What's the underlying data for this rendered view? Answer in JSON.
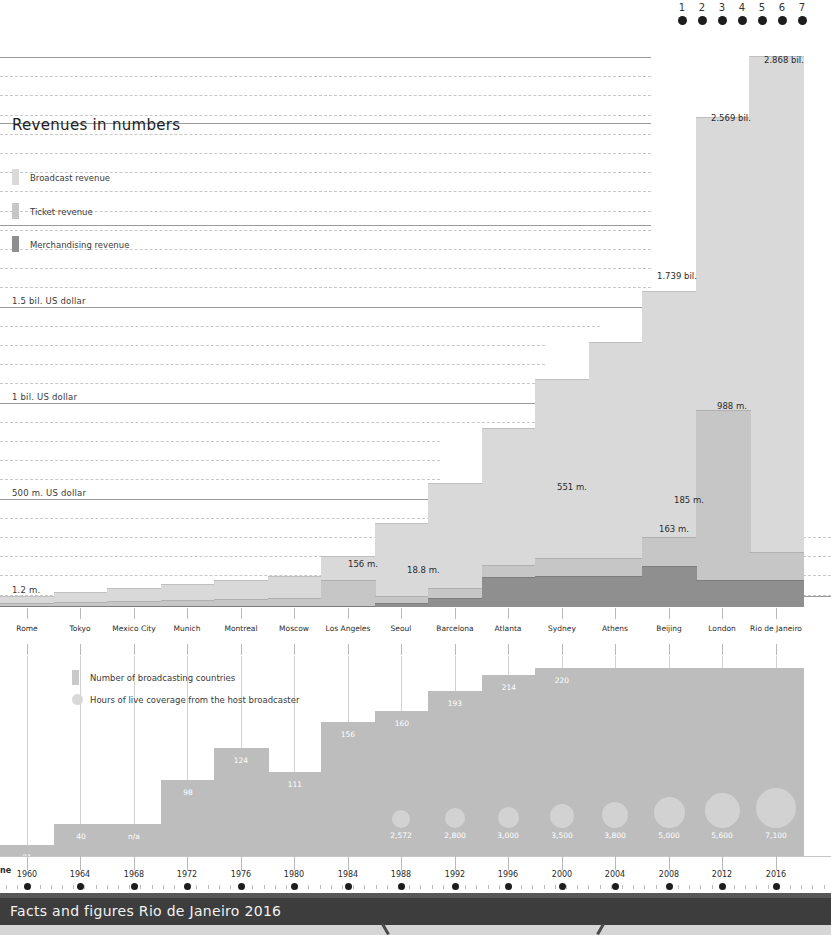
{
  "page_dots": {
    "numbers": [
      "1",
      "2",
      "3",
      "4",
      "5",
      "6",
      "7"
    ],
    "active_color": "#1d1d1d"
  },
  "revenue_section": {
    "title": "Revenues in numbers",
    "legend": [
      {
        "label": "Broadcast revenue",
        "color": "#d9d9d9"
      },
      {
        "label": "Ticket revenue",
        "color": "#c6c6c6"
      },
      {
        "label": "Merchandising revenue",
        "color": "#8f8f8f"
      }
    ],
    "axis_labels": [
      {
        "text": "1.5 bil. US dollar",
        "y": 307
      },
      {
        "text": "1 bil. US dollar",
        "y": 403
      },
      {
        "text": "500 m. US dollar",
        "y": 499
      },
      {
        "text": "1.2 m.",
        "y": 596
      }
    ],
    "value_labels": [
      {
        "text": "2.868 bil.",
        "x": 764,
        "y": 55
      },
      {
        "text": "2.569 bil.",
        "x": 711,
        "y": 113
      },
      {
        "text": "1.739 bil.",
        "x": 657,
        "y": 271
      },
      {
        "text": "988 m.",
        "x": 717,
        "y": 401
      },
      {
        "text": "551 m.",
        "x": 557,
        "y": 482
      },
      {
        "text": "185 m.",
        "x": 674,
        "y": 495
      },
      {
        "text": "163 m.",
        "x": 659,
        "y": 524
      },
      {
        "text": "156 m.",
        "x": 348,
        "y": 559
      },
      {
        "text": "18.8 m.",
        "x": 407,
        "y": 565
      }
    ]
  },
  "cities": [
    "Rome",
    "Tokyo",
    "Mexico City",
    "Munich",
    "Montreal",
    "Moscow",
    "Los Angeles",
    "Seoul",
    "Barcelona",
    "Atlanta",
    "Sydney",
    "Athens",
    "Beijing",
    "London",
    "Rio de Janeiro"
  ],
  "broadcast_section": {
    "legend": [
      {
        "label": "Number of broadcasting countries",
        "shape": "square-swatch"
      },
      {
        "label": "Hours of live coverage from the host broadcaster",
        "shape": "circle-swatch"
      }
    ]
  },
  "timeline": {
    "cut_label": "ne",
    "years": [
      "1960",
      "1964",
      "1968",
      "1972",
      "1976",
      "1980",
      "1984",
      "1988",
      "1992",
      "1996",
      "2000",
      "2004",
      "2008",
      "2012",
      "2016"
    ]
  },
  "footer": {
    "title": "Facts and figures Rio de Janeiro 2016"
  },
  "chart_data": [
    {
      "type": "bar",
      "title": "Revenues in numbers",
      "xlabel": "",
      "ylabel": "US dollar",
      "ylim": [
        0,
        3000000000
      ],
      "grid": true,
      "legend_position": "top-left",
      "categories": [
        "Rome",
        "Tokyo",
        "Mexico City",
        "Munich",
        "Montreal",
        "Moscow",
        "Los Angeles",
        "Seoul",
        "Barcelona",
        "Atlanta",
        "Sydney",
        "Athens",
        "Beijing",
        "London",
        "Rio de Janeiro"
      ],
      "years": [
        1960,
        1964,
        1968,
        1972,
        1976,
        1980,
        1984,
        1988,
        1992,
        1996,
        2000,
        2004,
        2008,
        2012,
        2016
      ],
      "annotations": [
        "2.868 bil.",
        "2.569 bil.",
        "1.739 bil.",
        "988 m.",
        "551 m.",
        "185 m.",
        "163 m.",
        "156 m.",
        "18.8 m.",
        "1.2 m."
      ],
      "series": [
        {
          "name": "Broadcast revenue",
          "values_display": [
            "1.2 m.",
            "",
            "",
            "",
            "",
            "",
            "156 m.",
            "",
            "",
            "551 m.",
            "",
            "",
            "1.739 bil.",
            "2.569 bil.",
            "2.868 bil."
          ],
          "top_px": [
            596,
            592,
            588,
            584,
            580,
            576,
            556,
            523,
            483,
            428,
            379,
            342,
            291,
            117,
            56
          ]
        },
        {
          "name": "Ticket revenue",
          "values_display": [
            "",
            "",
            "",
            "",
            "",
            "",
            "",
            "18.8 m.",
            "",
            "",
            "",
            "",
            "988 m.",
            "",
            ""
          ],
          "top_px": [
            603,
            602,
            601,
            600,
            599,
            598,
            580,
            596,
            588,
            565,
            558,
            558,
            537,
            410,
            552
          ]
        },
        {
          "name": "Merchandising revenue",
          "values_display": [
            "",
            "",
            "",
            "",
            "",
            "",
            "",
            "",
            "",
            "",
            "",
            "163 m.",
            "185 m.",
            "",
            ""
          ],
          "top_px": [
            606,
            606,
            606,
            606,
            606,
            606,
            606,
            603,
            598,
            577,
            576,
            576,
            566,
            580,
            580
          ]
        }
      ]
    },
    {
      "type": "bar",
      "title": "Number of broadcasting countries",
      "xlabel": "",
      "ylabel": "countries",
      "grid": true,
      "categories": [
        "Rome",
        "Tokyo",
        "Mexico City",
        "Munich",
        "Montreal",
        "Moscow",
        "Los Angeles",
        "Seoul",
        "Barcelona",
        "Atlanta",
        "Sydney",
        "Athens",
        "Beijing",
        "London",
        "Rio de Janeiro"
      ],
      "values": [
        21,
        40,
        null,
        98,
        124,
        111,
        156,
        160,
        193,
        214,
        220,
        220,
        220,
        220,
        220
      ],
      "value_labels": [
        "21",
        "40",
        "n/a",
        "98",
        "124",
        "111",
        "156",
        "160",
        "193",
        "214",
        "220",
        "",
        "",
        "",
        ""
      ]
    },
    {
      "type": "scatter",
      "title": "Hours of live coverage from the host broadcaster",
      "xlabel": "",
      "ylabel": "hours",
      "categories": [
        "Seoul",
        "Barcelona",
        "Atlanta",
        "Sydney",
        "Athens",
        "Beijing",
        "London",
        "Rio de Janeiro"
      ],
      "values": [
        2572,
        2800,
        3000,
        3500,
        3800,
        5000,
        5600,
        7100
      ],
      "value_labels": [
        "2,572",
        "2,800",
        "3,000",
        "3,500",
        "3,800",
        "5,000",
        "5,600",
        "7,100"
      ]
    }
  ]
}
